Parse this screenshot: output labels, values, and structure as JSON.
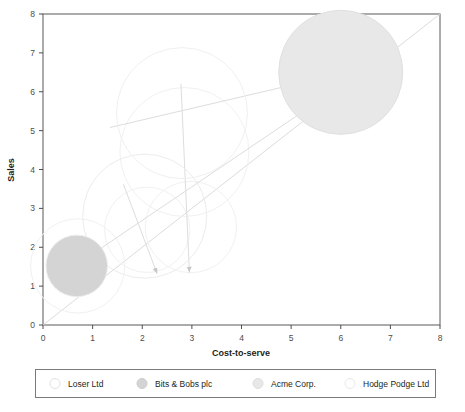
{
  "chart_data": {
    "type": "scatter",
    "title": "",
    "xlabel": "Cost-to-serve",
    "ylabel": "Sales",
    "xlim": [
      0,
      8
    ],
    "ylim": [
      0,
      8
    ],
    "xticks": [
      "0",
      "1",
      "2",
      "3",
      "4",
      "5",
      "6",
      "7",
      "8"
    ],
    "yticks": [
      "0",
      "1",
      "2",
      "3",
      "4",
      "5",
      "6",
      "7",
      "8"
    ],
    "grid": false,
    "legend_position": "bottom",
    "reference_line": {
      "name": "break-even-diagonal",
      "from": [
        0,
        0
      ],
      "to": [
        8,
        8
      ],
      "color": "#dcdcdc"
    },
    "series": [
      {
        "name": "Loser Ltd",
        "x": 2.05,
        "y": 2.8,
        "size": 1.25,
        "fill": "#ffffff",
        "stroke": "#ececec",
        "filled": false,
        "arrow_to_x": 2.25,
        "arrow_to_y": 1.45
      },
      {
        "name": "Bits & Bobs plc",
        "x": 0.68,
        "y": 1.52,
        "size": 0.62,
        "fill": "#d4d4d4",
        "stroke": "#ededed",
        "filled": true,
        "arrow_to_x": 0.68,
        "arrow_to_y": 1.52
      },
      {
        "name": "Acme Corp.",
        "x": 6.0,
        "y": 6.5,
        "size": 1.25,
        "fill": "#e8e8e8",
        "stroke": "#e0e0e0",
        "filled": true,
        "arrow_to_x": 6.12,
        "arrow_to_y": 6.52
      },
      {
        "name": "Hodge Podge Ltd",
        "x": 2.8,
        "y": 5.45,
        "size": 1.32,
        "fill": "#ffffff",
        "stroke": "#f0f0f0",
        "filled": false,
        "arrow_to_x": 2.85,
        "arrow_to_y": 4.45
      }
    ],
    "ghost_bubbles": [
      {
        "name": "hodge-podge-previous",
        "x": 2.85,
        "y": 4.45,
        "size": 1.3
      },
      {
        "name": "loser-previous",
        "x": 2.1,
        "y": 2.45,
        "size": 0.86
      },
      {
        "name": "acme-previous",
        "x": 2.98,
        "y": 2.52,
        "size": 0.92
      },
      {
        "name": "bits-bobs-previous",
        "x": 0.7,
        "y": 1.52,
        "size": 0.95
      }
    ],
    "trajectories": [
      {
        "name": "bits-to-acme-arrow",
        "from": [
          0.62,
          1.5
        ],
        "to": [
          6.55,
          6.62
        ]
      },
      {
        "name": "hodge-podge-arrow",
        "from": [
          2.78,
          6.2
        ],
        "to": [
          2.95,
          1.35
        ]
      },
      {
        "name": "loser-arrow",
        "from": [
          1.62,
          3.62
        ],
        "to": [
          2.3,
          1.32
        ]
      },
      {
        "name": "acme-shift-arrow",
        "from": [
          1.35,
          5.08
        ],
        "to": [
          6.85,
          6.72
        ]
      }
    ]
  },
  "axes": {
    "x_label": "Cost-to-serve",
    "y_label": "Sales"
  },
  "legend": {
    "items": [
      {
        "label": "Loser Ltd",
        "marker_fill": "#ffffff",
        "marker_stroke": "#e2e2e2"
      },
      {
        "label": "Bits & Bobs plc",
        "marker_fill": "#d4d4d4",
        "marker_stroke": "#cccccc"
      },
      {
        "label": "Acme Corp.",
        "marker_fill": "#e8e8e8",
        "marker_stroke": "#dedede"
      },
      {
        "label": "Hodge Podge Ltd",
        "marker_fill": "#ffffff",
        "marker_stroke": "#e8e8e8"
      }
    ]
  },
  "colors": {
    "frame": "#595959",
    "tick": "#4d4d4d",
    "text": "#231f20",
    "reference_line": "#dcdcdc",
    "legend_border": "#7a7a7a",
    "background": "#ffffff"
  }
}
